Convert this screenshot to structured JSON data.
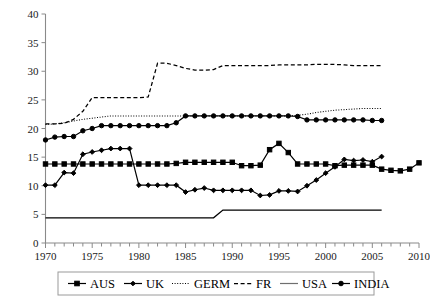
{
  "chart_data": {
    "type": "line",
    "title": "",
    "subtitle": "",
    "xlabel": "",
    "ylabel": "",
    "xlim": [
      1970,
      2010
    ],
    "ylim": [
      0,
      40
    ],
    "ytick_step": 5,
    "xtick_step": 5,
    "xtick_minor_step": 1,
    "grid": false,
    "legend_position": "bottom",
    "ytick_labels": [
      "0",
      "5",
      "10",
      "15",
      "20",
      "25",
      "30",
      "35",
      "40"
    ],
    "ytick_values": [
      0,
      5,
      10,
      15,
      20,
      25,
      30,
      35,
      40
    ],
    "xtick_labels": [
      "1970",
      "1975",
      "1980",
      "1985",
      "1990",
      "1995",
      "2000",
      "2005",
      "2010"
    ],
    "xtick_values": [
      1970,
      1975,
      1980,
      1985,
      1990,
      1995,
      2000,
      2005,
      2010
    ],
    "series": [
      {
        "name": "AUS",
        "style": "solid",
        "marker": "square",
        "color": "#000000",
        "x": [
          1970,
          1971,
          1972,
          1973,
          1974,
          1975,
          1976,
          1977,
          1978,
          1979,
          1980,
          1981,
          1982,
          1983,
          1984,
          1985,
          1986,
          1987,
          1988,
          1989,
          1990,
          1991,
          1992,
          1993,
          1994,
          1995,
          1996,
          1997,
          1998,
          1999,
          2000,
          2001,
          2002,
          2003,
          2004,
          2005,
          2006,
          2007,
          2008,
          2009,
          2010
        ],
        "values": [
          13.8,
          13.8,
          13.8,
          13.8,
          13.8,
          13.8,
          13.8,
          13.8,
          13.8,
          13.8,
          13.8,
          13.8,
          13.8,
          13.8,
          13.9,
          14.1,
          14.1,
          14.1,
          14.1,
          14.1,
          14.1,
          13.5,
          13.5,
          13.6,
          16.3,
          17.4,
          15.8,
          13.8,
          13.8,
          13.8,
          13.8,
          13.5,
          13.6,
          13.6,
          13.6,
          13.6,
          12.9,
          12.7,
          12.6,
          12.9,
          14.0
        ]
      },
      {
        "name": "UK",
        "style": "solid",
        "marker": "diamond",
        "color": "#000000",
        "x": [
          1970,
          1971,
          1972,
          1973,
          1974,
          1975,
          1976,
          1977,
          1978,
          1979,
          1980,
          1981,
          1982,
          1983,
          1984,
          1985,
          1986,
          1987,
          1988,
          1989,
          1990,
          1991,
          1992,
          1993,
          1994,
          1995,
          1996,
          1997,
          1998,
          1999,
          2000,
          2001,
          2002,
          2003,
          2004,
          2005,
          2006
        ],
        "values": [
          10.1,
          10.1,
          12.3,
          12.2,
          15.5,
          15.9,
          16.2,
          16.5,
          16.5,
          16.5,
          10.1,
          10.1,
          10.1,
          10.1,
          10.1,
          8.9,
          9.3,
          9.6,
          9.2,
          9.2,
          9.2,
          9.2,
          9.2,
          8.3,
          8.4,
          9.1,
          9.1,
          9.0,
          10.0,
          11.0,
          12.2,
          13.3,
          14.6,
          14.4,
          14.5,
          14.2,
          15.1
        ]
      },
      {
        "name": "GERM",
        "style": "dotted",
        "marker": "none",
        "color": "#000000",
        "x": [
          1970,
          1971,
          1972,
          1973,
          1974,
          1975,
          1976,
          1977,
          1978,
          1979,
          1980,
          1981,
          1982,
          1983,
          1984,
          1985,
          1986,
          1987,
          1988,
          1989,
          1990,
          1991,
          1992,
          1993,
          1994,
          1995,
          1996,
          1997,
          1998,
          1999,
          2000,
          2001,
          2002,
          2003,
          2004,
          2005,
          2006
        ],
        "values": [
          20.7,
          20.8,
          21.0,
          21.3,
          21.6,
          21.8,
          22.0,
          22.2,
          22.2,
          22.2,
          22.2,
          22.2,
          22.2,
          22.2,
          22.2,
          22.2,
          22.2,
          22.2,
          22.2,
          22.2,
          22.2,
          22.2,
          22.2,
          22.2,
          22.2,
          22.2,
          22.2,
          22.3,
          22.5,
          22.8,
          23.0,
          23.2,
          23.3,
          23.4,
          23.5,
          23.5,
          23.5
        ]
      },
      {
        "name": "FR",
        "style": "dashed",
        "marker": "none",
        "color": "#000000",
        "x": [
          1970,
          1971,
          1972,
          1973,
          1974,
          1975,
          1976,
          1977,
          1978,
          1979,
          1980,
          1981,
          1982,
          1983,
          1984,
          1985,
          1986,
          1987,
          1988,
          1989,
          1990,
          1991,
          1992,
          1993,
          1994,
          1995,
          1996,
          1997,
          1998,
          1999,
          2000,
          2001,
          2002,
          2003,
          2004,
          2005,
          2006
        ],
        "values": [
          20.8,
          20.8,
          20.9,
          21.6,
          23.0,
          25.4,
          25.4,
          25.4,
          25.4,
          25.4,
          25.4,
          25.5,
          31.4,
          31.4,
          31.0,
          30.5,
          30.2,
          30.2,
          30.3,
          31.0,
          31.0,
          31.0,
          31.0,
          31.0,
          31.0,
          31.1,
          31.1,
          31.1,
          31.1,
          31.2,
          31.2,
          31.2,
          31.1,
          31.0,
          31.0,
          31.0,
          31.0
        ]
      },
      {
        "name": "USA",
        "style": "solid",
        "marker": "none",
        "color": "#6f6f6f",
        "x": [
          1970,
          1971,
          1972,
          1973,
          1974,
          1975,
          1976,
          1977,
          1978,
          1979,
          1980,
          1981,
          1982,
          1983,
          1984,
          1985,
          1986,
          1987,
          1988,
          1989,
          1990,
          1991,
          1992,
          1993,
          1994,
          1995,
          1996,
          1997,
          1998,
          1999,
          2000,
          2001,
          2002,
          2003,
          2004,
          2005,
          2006
        ],
        "values": [
          4.4,
          4.4,
          4.4,
          4.4,
          4.4,
          4.4,
          4.4,
          4.4,
          4.4,
          4.4,
          4.4,
          4.4,
          4.4,
          4.4,
          4.4,
          4.4,
          4.4,
          4.4,
          4.4,
          5.75,
          5.75,
          5.75,
          5.75,
          5.75,
          5.75,
          5.75,
          5.75,
          5.75,
          5.75,
          5.75,
          5.75,
          5.75,
          5.75,
          5.75,
          5.75,
          5.75,
          5.75
        ]
      },
      {
        "name": "INDIA",
        "style": "solid",
        "marker": "circle",
        "color": "#000000",
        "x": [
          1970,
          1971,
          1972,
          1973,
          1974,
          1975,
          1976,
          1977,
          1978,
          1979,
          1980,
          1981,
          1982,
          1983,
          1984,
          1985,
          1986,
          1987,
          1988,
          1989,
          1990,
          1991,
          1992,
          1993,
          1994,
          1995,
          1996,
          1997,
          1998,
          1999,
          2000,
          2001,
          2002,
          2003,
          2004,
          2005,
          2006
        ],
        "values": [
          18.0,
          18.5,
          18.6,
          18.6,
          19.6,
          20.0,
          20.5,
          20.5,
          20.5,
          20.5,
          20.5,
          20.5,
          20.5,
          20.5,
          21.0,
          22.2,
          22.2,
          22.2,
          22.2,
          22.2,
          22.2,
          22.2,
          22.2,
          22.2,
          22.2,
          22.2,
          22.2,
          22.1,
          21.5,
          21.5,
          21.5,
          21.5,
          21.5,
          21.5,
          21.5,
          21.4,
          21.4
        ]
      }
    ]
  },
  "legend": {
    "items": [
      {
        "label": "AUS",
        "marker": "square",
        "style": "solid"
      },
      {
        "label": "UK",
        "marker": "diamond",
        "style": "solid"
      },
      {
        "label": "GERM",
        "marker": "none",
        "style": "dotted"
      },
      {
        "label": "FR",
        "marker": "none",
        "style": "dashed"
      },
      {
        "label": "USA",
        "marker": "none",
        "style": "solid"
      },
      {
        "label": "INDIA",
        "marker": "circle",
        "style": "solid"
      }
    ]
  }
}
